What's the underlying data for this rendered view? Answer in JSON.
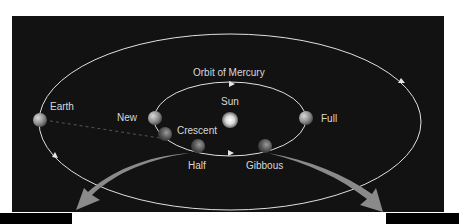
{
  "diagram": {
    "title": "Orbit of Mercury",
    "labels": {
      "earth": "Earth",
      "sun": "Sun",
      "new": "New",
      "crescent": "Crescent",
      "half": "Half",
      "gibbous": "Gibbous",
      "full": "Full",
      "orbit": "Orbit of Mercury"
    },
    "colors": {
      "background": "#121212",
      "orbit_line": "#e0e0e0",
      "arrow": "#8a8a8a",
      "text": "#d8d8d8"
    }
  }
}
